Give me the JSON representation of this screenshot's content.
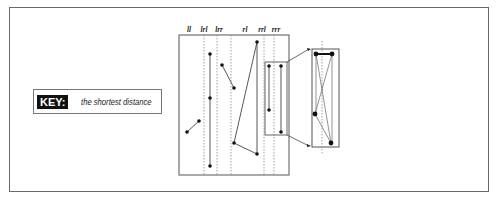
{
  "key": {
    "label": "KEY:",
    "description": "the shortest distance"
  },
  "columns": [
    {
      "label": "ll",
      "x": 189
    },
    {
      "label": "lrl",
      "x": 204
    },
    {
      "label": "lrr",
      "x": 219
    },
    {
      "label": "rl",
      "x": 245
    },
    {
      "label": "rrl",
      "x": 262
    },
    {
      "label": "rrr",
      "x": 276
    }
  ],
  "main_box": {
    "x": 179,
    "y": 35,
    "w": 110,
    "h": 140
  },
  "dividers_x": [
    204,
    217,
    231,
    264,
    274
  ],
  "segments": [
    {
      "x1": 187,
      "y1": 132,
      "x2": 199,
      "y2": 121
    },
    {
      "x1": 210,
      "y1": 54,
      "x2": 210,
      "y2": 166
    },
    {
      "x1": 222,
      "y1": 65,
      "x2": 234,
      "y2": 88
    },
    {
      "x1": 234,
      "y1": 143,
      "x2": 257,
      "y2": 42
    },
    {
      "x1": 234,
      "y1": 143,
      "x2": 257,
      "y2": 154
    },
    {
      "x1": 257,
      "y1": 42,
      "x2": 257,
      "y2": 154
    },
    {
      "x1": 269,
      "y1": 66,
      "x2": 269,
      "y2": 110
    },
    {
      "x1": 281,
      "y1": 66,
      "x2": 281,
      "y2": 132
    }
  ],
  "points": [
    [
      187,
      132
    ],
    [
      199,
      121
    ],
    [
      210,
      54
    ],
    [
      210,
      98
    ],
    [
      210,
      166
    ],
    [
      222,
      65
    ],
    [
      234,
      88
    ],
    [
      234,
      143
    ],
    [
      257,
      42
    ],
    [
      257,
      154
    ],
    [
      269,
      66
    ],
    [
      269,
      110
    ],
    [
      281,
      66
    ],
    [
      281,
      132
    ]
  ],
  "highlight_box": {
    "x": 265,
    "y": 62,
    "w": 22,
    "h": 73
  },
  "zoom_box": {
    "x": 312,
    "y": 49,
    "w": 27,
    "h": 98,
    "divider_x": 322
  },
  "zoom_points": [
    [
      316,
      54
    ],
    [
      332,
      54
    ],
    [
      315,
      114
    ],
    [
      331,
      143
    ]
  ],
  "zoom_segments": [
    {
      "x1": 316,
      "y1": 54,
      "x2": 332,
      "y2": 54,
      "bold": true
    },
    {
      "x1": 316,
      "y1": 54,
      "x2": 331,
      "y2": 143
    },
    {
      "x1": 332,
      "y1": 54,
      "x2": 315,
      "y2": 114
    },
    {
      "x1": 316,
      "y1": 54,
      "x2": 316,
      "y2": 114
    },
    {
      "x1": 332,
      "y1": 54,
      "x2": 332,
      "y2": 143
    },
    {
      "x1": 315,
      "y1": 114,
      "x2": 331,
      "y2": 143
    }
  ]
}
